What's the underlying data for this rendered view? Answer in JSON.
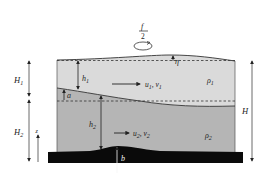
{
  "diagram": {
    "rotation": {
      "numerator": "f",
      "denominator": "2",
      "icon": "rotation-arrow-icon"
    },
    "labels": {
      "eta": "η",
      "h1": "h",
      "h1_sub": "1",
      "h2": "h",
      "h2_sub": "2",
      "a": "a",
      "b": "b",
      "z": "z",
      "H1": "H",
      "H1_sub": "1",
      "H2": "H",
      "H2_sub": "2",
      "H": "H",
      "u1v1": "u",
      "u1v1_sub1": "1",
      "u1v1_mid": ", v",
      "u1v1_sub2": "1",
      "u2v2": "u",
      "u2v2_sub1": "2",
      "u2v2_mid": ", v",
      "u2v2_sub2": "2",
      "rho1": "ρ",
      "rho1_sub": "1",
      "rho2": "ρ",
      "rho2_sub": "2"
    },
    "colors": {
      "upper_layer": "#dadada",
      "lower_layer": "#b5b5b5",
      "bottom": "#0a0a0a",
      "lines": "#333333"
    }
  }
}
